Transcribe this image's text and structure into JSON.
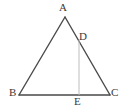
{
  "figure": {
    "name": "triangle-abc-with-cevian-de",
    "background_color": "#ffffff",
    "stroke_color": "#4a4a4a",
    "light_stroke_color": "#bdbdbd",
    "label_color": "#3a3a3a",
    "labels": {
      "a": "A",
      "b": "B",
      "c": "C",
      "d": "D",
      "e": "E"
    },
    "points": {
      "a": {
        "x": 65,
        "y": 17
      },
      "b": {
        "x": 19,
        "y": 95
      },
      "c": {
        "x": 110,
        "y": 95
      },
      "d": {
        "x": 79,
        "y": 40
      },
      "e": {
        "x": 79,
        "y": 95
      }
    },
    "segments": [
      {
        "name": "segment-ab",
        "from": "a",
        "to": "b",
        "style": "solid-dark"
      },
      {
        "name": "segment-ac",
        "from": "a",
        "to": "c",
        "style": "solid-dark"
      },
      {
        "name": "segment-bc",
        "from": "b",
        "to": "c",
        "style": "solid-dark"
      },
      {
        "name": "segment-de",
        "from": "d",
        "to": "e",
        "style": "solid-light"
      }
    ]
  }
}
